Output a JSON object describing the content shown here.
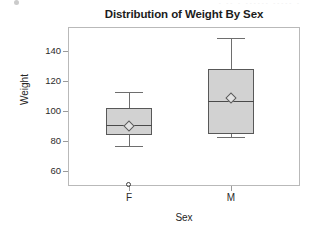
{
  "artifact": {
    "ghost_text": "-  --  -   ------  -----  -"
  },
  "chart_data": {
    "type": "box",
    "title": "Distribution of Weight By Sex",
    "xlabel": "Sex",
    "ylabel": "Weight",
    "categories": [
      "F",
      "M"
    ],
    "ytick_labels": [
      "140",
      "120",
      "100",
      "80",
      "60"
    ],
    "ytick_values": [
      140,
      120,
      100,
      80,
      60
    ],
    "ylim": [
      46,
      155
    ],
    "grid": false,
    "legend": "none",
    "series": [
      {
        "name": "F",
        "whisker_low": 77,
        "q1": 84,
        "median": 91,
        "q3": 102,
        "whisker_high": 113,
        "mean": 90,
        "outliers": [
          51
        ]
      },
      {
        "name": "M",
        "whisker_low": 83,
        "q1": 85,
        "median": 107,
        "q3": 128,
        "whisker_high": 149,
        "mean": 109,
        "outliers": []
      }
    ],
    "colors": {
      "box_fill": "#d2d2d2",
      "box_border": "#585858",
      "median": "#4a4a4a",
      "whisker": "#6e6e6e",
      "frame": "#b9b9b9",
      "text": "#262626"
    }
  }
}
